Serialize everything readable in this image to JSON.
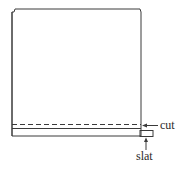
{
  "diagram": {
    "labels": {
      "cut": "cut",
      "slat": "slat"
    },
    "colors": {
      "stroke": "#3a3a3a",
      "background": "#ffffff"
    }
  }
}
